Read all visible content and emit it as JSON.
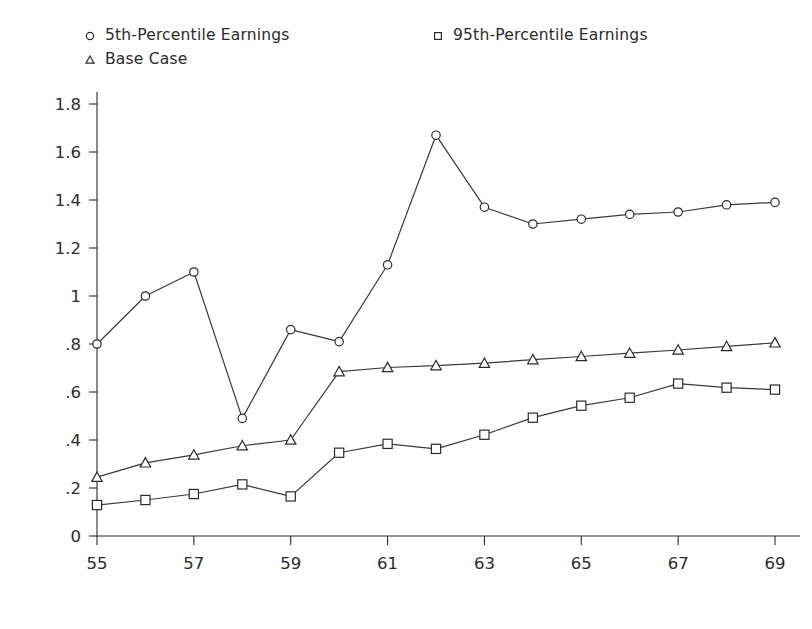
{
  "chart_data": {
    "type": "line",
    "title": "",
    "subtitle": "",
    "xlabel": "",
    "ylabel": "",
    "x": [
      55,
      56,
      57,
      58,
      59,
      60,
      61,
      62,
      63,
      64,
      65,
      66,
      67,
      68,
      69
    ],
    "xtick_labels": [
      "55",
      "57",
      "59",
      "61",
      "63",
      "65",
      "67",
      "69"
    ],
    "xtick_values": [
      55,
      57,
      59,
      61,
      63,
      65,
      67,
      69
    ],
    "xlim": [
      55,
      69
    ],
    "ytick_labels": [
      "0",
      ".2",
      ".4",
      ".6",
      ".8",
      "1",
      "1.2",
      "1.4",
      "1.6",
      "1.8"
    ],
    "ytick_values": [
      0,
      0.2,
      0.4,
      0.6,
      0.8,
      1,
      1.2,
      1.4,
      1.6,
      1.8
    ],
    "ylim": [
      0,
      1.8
    ],
    "grid": false,
    "legend_position": "top",
    "series": [
      {
        "name": "5th-Percentile Earnings",
        "marker": "circle",
        "color": "#2b2b2b",
        "values": [
          0.8,
          1.0,
          1.1,
          0.49,
          0.86,
          0.81,
          1.13,
          1.67,
          1.37,
          1.3,
          1.32,
          1.34,
          1.35,
          1.38,
          1.39
        ]
      },
      {
        "name": "Base Case",
        "marker": "triangle",
        "color": "#2b2b2b",
        "values": [
          0.245,
          0.305,
          0.338,
          0.376,
          0.4,
          0.685,
          0.702,
          0.71,
          0.72,
          0.735,
          0.748,
          0.762,
          0.775,
          0.79,
          0.805
        ]
      },
      {
        "name": "95th-Percentile Earnings",
        "marker": "square",
        "color": "#2b2b2b",
        "values": [
          0.129,
          0.15,
          0.175,
          0.215,
          0.165,
          0.347,
          0.384,
          0.363,
          0.422,
          0.493,
          0.543,
          0.576,
          0.635,
          0.618,
          0.61
        ]
      }
    ],
    "legend": [
      {
        "label": "5th-Percentile Earnings",
        "marker": "circle"
      },
      {
        "label": "Base Case",
        "marker": "triangle"
      },
      {
        "label": "95th-Percentile Earnings",
        "marker": "square"
      }
    ]
  }
}
